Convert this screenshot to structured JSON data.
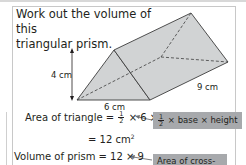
{
  "question": {
    "line1": "Work out the volume of this",
    "line2": "triangular prism."
  },
  "figure": {
    "height_label": "4 cm",
    "base_label": "6 cm",
    "length_label": "9 cm",
    "fill_color": "#d1d3d4",
    "edge_color": "#3c3c3c"
  },
  "working": {
    "area_lhs": "Area of triangle = ",
    "area_frac_num": "1",
    "area_frac_den": "2",
    "area_rhs": " × 6 × 4",
    "area_result": "= 12 cm",
    "area_result_sup": "2",
    "volume_lhs": "Volume of prism = 12 × 9"
  },
  "notes": {
    "area_note_frac_num": "1",
    "area_note_frac_den": "2",
    "area_note_text": " × base × height",
    "volume_note_text": "Area of cross-",
    "bg_color": "#a7a9ac"
  }
}
